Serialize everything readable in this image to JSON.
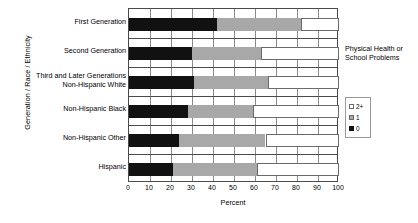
{
  "chart_data": {
    "type": "bar",
    "orientation": "horizontal",
    "stacked": true,
    "stack_mode": "percent",
    "title": "",
    "xlabel": "Percent",
    "ylabel": "Generation / Race / Ethnicity",
    "xlim": [
      0,
      100
    ],
    "xticks": [
      0,
      10,
      20,
      30,
      40,
      50,
      60,
      70,
      80,
      90,
      100
    ],
    "grid": true,
    "legend_position": "right",
    "legend_title": "Physical Health or School Problems",
    "categories": [
      "First Generation",
      "Second Generation",
      "Third and Later Generations\nNon-Hispanic White",
      "Non-Hispanic Black",
      "Non-Hispanic Other",
      "Hispanic"
    ],
    "category_lines": [
      [
        "First Generation"
      ],
      [
        "Second Generation"
      ],
      [
        "Third and Later Generations",
        "Non-Hispanic White"
      ],
      [
        "Non-Hispanic Black"
      ],
      [
        "Non-Hispanic Other"
      ],
      [
        "Hispanic"
      ]
    ],
    "series": [
      {
        "name": "0",
        "color": "#111111",
        "values": [
          42,
          30,
          31,
          28,
          24,
          21
        ]
      },
      {
        "name": "1",
        "color": "#a8a8a8",
        "values": [
          40,
          33,
          35,
          31,
          41,
          40
        ]
      },
      {
        "name": "2+",
        "color": "#ffffff",
        "values": [
          18,
          37,
          34,
          41,
          35,
          39
        ]
      }
    ],
    "legend_entries": [
      {
        "label": "2+",
        "swatch": "s2"
      },
      {
        "label": "1",
        "swatch": "s1"
      },
      {
        "label": "0",
        "swatch": "s0"
      }
    ]
  }
}
